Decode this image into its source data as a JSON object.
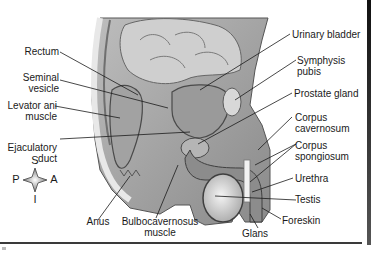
{
  "figure": {
    "left_labels": [
      {
        "id": "rectum",
        "lines": [
          "Rectum"
        ]
      },
      {
        "id": "seminal-vesicle",
        "lines": [
          "Seminal",
          "vesicle"
        ]
      },
      {
        "id": "levator-ani-muscle",
        "lines": [
          "Levator ani",
          "muscle"
        ]
      },
      {
        "id": "ejaculatory-duct",
        "lines": [
          "Ejaculatory",
          "duct"
        ]
      }
    ],
    "right_labels": [
      {
        "id": "urinary-bladder",
        "lines": [
          "Urinary bladder"
        ]
      },
      {
        "id": "symphysis-pubis",
        "lines": [
          "Symphysis",
          "pubis"
        ]
      },
      {
        "id": "prostate-gland",
        "lines": [
          "Prostate gland"
        ]
      },
      {
        "id": "corpus-cavernosum",
        "lines": [
          "Corpus",
          "cavernosum"
        ]
      },
      {
        "id": "corpus-spongiosum",
        "lines": [
          "Corpus",
          "spongiosum"
        ]
      },
      {
        "id": "urethra",
        "lines": [
          "Urethra"
        ]
      },
      {
        "id": "testis",
        "lines": [
          "Testis"
        ]
      },
      {
        "id": "foreskin",
        "lines": [
          "Foreskin"
        ]
      }
    ],
    "bottom_labels": [
      {
        "id": "anus",
        "lines": [
          "Anus"
        ]
      },
      {
        "id": "bulbocavernosus-muscle",
        "lines": [
          "Bulbocavernosus",
          "muscle"
        ]
      },
      {
        "id": "glans",
        "lines": [
          "Glans"
        ]
      }
    ],
    "compass": {
      "top": "S",
      "bottom": "I",
      "left": "P",
      "right": "A"
    }
  }
}
